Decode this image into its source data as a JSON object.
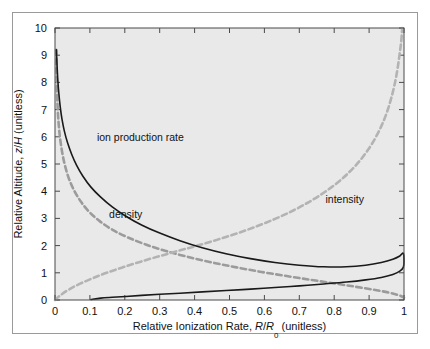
{
  "figure": {
    "background_color": "#ffffff",
    "frame_border_color": "#9a9a9a",
    "plot_background_color": "#e9e9e9",
    "axis_color": "#4a4a4a"
  },
  "chart_data": {
    "type": "line",
    "title": "",
    "subtitle": "",
    "xlabel": "Relative Ionization Rate, R/R0 (unitless)",
    "xlabel_parts": {
      "lead": "Relative Ionization Rate, ",
      "italic_r": "R",
      "slash": "/",
      "italic_r2": "R",
      "subscript": "0",
      "trail": " (unitless)"
    },
    "ylabel": "Relative Altitude, z/H (unitless)",
    "ylabel_parts": {
      "lead": "Relative Altitude, ",
      "italic_z": "z",
      "slash": "/",
      "italic_h": "H",
      "trail": " (unitless)"
    },
    "xlim": [
      0,
      1
    ],
    "ylim": [
      0,
      10
    ],
    "xticks": [
      0,
      0.1,
      0.2,
      0.3,
      0.4,
      0.5,
      0.6,
      0.7,
      0.8,
      0.9,
      1
    ],
    "xtick_labels": [
      "0",
      "0.1",
      "0.2",
      "0.3",
      "0.4",
      "0.5",
      "0.6",
      "0.7",
      "0.8",
      "0.9",
      "1"
    ],
    "yticks": [
      0,
      1,
      2,
      3,
      4,
      5,
      6,
      7,
      8,
      9,
      10
    ],
    "ytick_labels": [
      "0",
      "1",
      "2",
      "3",
      "4",
      "5",
      "6",
      "7",
      "8",
      "9",
      "10"
    ],
    "grid": false,
    "ticks_all_sides": true,
    "legend": "inline-annotations",
    "legend_position": "inline",
    "series": [
      {
        "name": "ion production rate",
        "style": "solid",
        "color": "#1a1a1a",
        "line_width": 1.6,
        "label_x": 0.12,
        "label_y": 5.85,
        "description": "Chapman production function; peaks at R/R0 = 1 near z/H = 1.4",
        "points": [
          [
            0.004,
            9.2
          ],
          [
            0.006,
            8.6
          ],
          [
            0.008,
            8.1
          ],
          [
            0.011,
            7.6
          ],
          [
            0.015,
            7.1
          ],
          [
            0.02,
            6.65
          ],
          [
            0.027,
            6.2
          ],
          [
            0.036,
            5.78
          ],
          [
            0.048,
            5.35
          ],
          [
            0.062,
            4.95
          ],
          [
            0.08,
            4.55
          ],
          [
            0.103,
            4.15
          ],
          [
            0.131,
            3.78
          ],
          [
            0.164,
            3.42
          ],
          [
            0.203,
            3.08
          ],
          [
            0.248,
            2.76
          ],
          [
            0.3,
            2.46
          ],
          [
            0.358,
            2.18
          ],
          [
            0.422,
            1.92
          ],
          [
            0.49,
            1.7
          ],
          [
            0.56,
            1.52
          ],
          [
            0.63,
            1.38
          ],
          [
            0.7,
            1.28
          ],
          [
            0.77,
            1.22
          ],
          [
            0.835,
            1.22
          ],
          [
            0.89,
            1.28
          ],
          [
            0.935,
            1.38
          ],
          [
            0.968,
            1.5
          ],
          [
            0.988,
            1.62
          ],
          [
            0.998,
            1.72
          ],
          [
            1.0,
            1.42
          ],
          [
            0.998,
            1.2
          ],
          [
            0.988,
            1.06
          ],
          [
            0.968,
            0.94
          ],
          [
            0.935,
            0.83
          ],
          [
            0.89,
            0.74
          ],
          [
            0.835,
            0.66
          ],
          [
            0.77,
            0.59
          ],
          [
            0.7,
            0.52
          ],
          [
            0.63,
            0.46
          ],
          [
            0.56,
            0.4
          ],
          [
            0.49,
            0.35
          ],
          [
            0.422,
            0.3
          ],
          [
            0.358,
            0.25
          ],
          [
            0.3,
            0.21
          ],
          [
            0.248,
            0.17
          ],
          [
            0.203,
            0.13
          ],
          [
            0.164,
            0.1
          ],
          [
            0.131,
            0.07
          ],
          [
            0.103,
            0.02
          ]
        ]
      },
      {
        "name": "density",
        "style": "dashed",
        "color": "#9b9b9b",
        "line_width": 2.6,
        "label_x": 0.155,
        "label_y": 3.02,
        "description": "Neutral atmospheric density decreasing exponentially with altitude",
        "points": [
          [
            0.0035,
            9.2
          ],
          [
            0.0045,
            8.4
          ],
          [
            0.006,
            7.6
          ],
          [
            0.008,
            6.95
          ],
          [
            0.011,
            6.4
          ],
          [
            0.015,
            5.9
          ],
          [
            0.021,
            5.4
          ],
          [
            0.029,
            4.92
          ],
          [
            0.04,
            4.46
          ],
          [
            0.055,
            4.02
          ],
          [
            0.074,
            3.62
          ],
          [
            0.098,
            3.24
          ],
          [
            0.128,
            2.9
          ],
          [
            0.165,
            2.58
          ],
          [
            0.209,
            2.3
          ],
          [
            0.26,
            2.04
          ],
          [
            0.318,
            1.8
          ],
          [
            0.382,
            1.58
          ],
          [
            0.45,
            1.38
          ],
          [
            0.52,
            1.2
          ],
          [
            0.592,
            1.03
          ],
          [
            0.664,
            0.88
          ],
          [
            0.734,
            0.74
          ],
          [
            0.8,
            0.61
          ],
          [
            0.86,
            0.49
          ],
          [
            0.912,
            0.38
          ],
          [
            0.954,
            0.28
          ],
          [
            0.982,
            0.19
          ],
          [
            0.996,
            0.12
          ],
          [
            1.0,
            0.08
          ]
        ]
      },
      {
        "name": "intensity",
        "style": "dashed",
        "color": "#b3b3b3",
        "line_width": 2.6,
        "label_x": 0.775,
        "label_y": 3.55,
        "description": "Solar radiation intensity rising asymptotically to unity with altitude",
        "points": [
          [
            0.0,
            0.0
          ],
          [
            0.018,
            0.2
          ],
          [
            0.042,
            0.4
          ],
          [
            0.072,
            0.6
          ],
          [
            0.108,
            0.8
          ],
          [
            0.148,
            1.0
          ],
          [
            0.194,
            1.2
          ],
          [
            0.243,
            1.4
          ],
          [
            0.296,
            1.6
          ],
          [
            0.351,
            1.8
          ],
          [
            0.408,
            2.0
          ],
          [
            0.466,
            2.22
          ],
          [
            0.524,
            2.46
          ],
          [
            0.58,
            2.72
          ],
          [
            0.634,
            3.0
          ],
          [
            0.684,
            3.3
          ],
          [
            0.73,
            3.62
          ],
          [
            0.772,
            3.96
          ],
          [
            0.81,
            4.32
          ],
          [
            0.843,
            4.7
          ],
          [
            0.872,
            5.1
          ],
          [
            0.897,
            5.52
          ],
          [
            0.918,
            5.96
          ],
          [
            0.936,
            6.42
          ],
          [
            0.951,
            6.9
          ],
          [
            0.963,
            7.4
          ],
          [
            0.973,
            7.92
          ],
          [
            0.981,
            8.46
          ],
          [
            0.987,
            9.0
          ],
          [
            0.992,
            9.5
          ],
          [
            0.995,
            10.0
          ]
        ]
      }
    ]
  }
}
